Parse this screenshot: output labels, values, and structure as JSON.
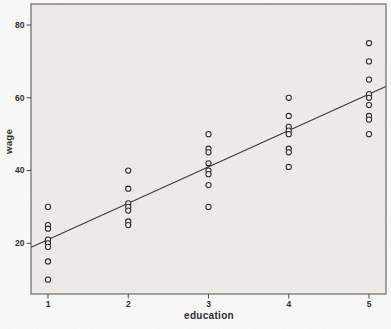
{
  "chart_data": {
    "type": "scatter",
    "title": "",
    "xlabel": "education",
    "ylabel": "wage",
    "x_ticks": [
      1,
      2,
      3,
      4,
      5
    ],
    "y_ticks": [
      20,
      40,
      60,
      80
    ],
    "xlim": [
      0.79,
      5.21
    ],
    "ylim": [
      6,
      86
    ],
    "grid": false,
    "legend": "none",
    "marker": "open-circle",
    "groups": [
      {
        "education": 1,
        "wages": [
          30,
          25,
          24,
          21,
          20,
          19,
          15,
          10
        ]
      },
      {
        "education": 2,
        "wages": [
          40,
          35,
          31,
          30,
          29,
          26,
          25
        ]
      },
      {
        "education": 3,
        "wages": [
          50,
          46,
          45,
          42,
          40,
          39,
          36,
          30
        ]
      },
      {
        "education": 4,
        "wages": [
          60,
          55,
          52,
          51,
          50,
          46,
          45,
          41
        ]
      },
      {
        "education": 5,
        "wages": [
          75,
          70,
          65,
          61,
          60,
          58,
          55,
          54,
          50
        ]
      }
    ],
    "fit_line": {
      "x1": 0.79,
      "y1": 18.9,
      "x2": 5.21,
      "y2": 63.1
    }
  },
  "colors": {
    "plot_bg": "#eeedea",
    "outer_bg": "#fbfbf9",
    "frame": "#4a4a4a",
    "fit_line": "#3c3c3c",
    "point_stroke": "#2a2a2a",
    "point_fill": "#f1f0ed",
    "text": "#2e2e2e"
  }
}
